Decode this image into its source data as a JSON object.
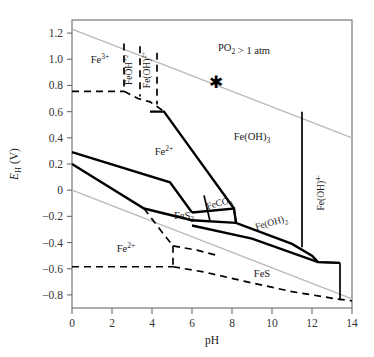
{
  "figure": {
    "title": "",
    "background": "#ffffff"
  },
  "chart_data": {
    "type": "line",
    "subtype": "eh-ph-pourbaix-diagram",
    "title": "",
    "xlabel": "pH",
    "ylabel": "EH (V)",
    "ylabel_parts": {
      "italic": "E",
      "subscript": "H",
      "unit": "(V)"
    },
    "xlim": [
      0,
      14
    ],
    "ylim": [
      -0.9,
      1.3
    ],
    "xticks": [
      0,
      2,
      4,
      6,
      8,
      10,
      12,
      14
    ],
    "xticklabels": [
      "0",
      "2",
      "4",
      "6",
      "8",
      "10",
      "12",
      "14"
    ],
    "yticks": [
      1.2,
      1.0,
      0.8,
      0.6,
      0.4,
      0.2,
      0,
      -0.2,
      -0.4,
      -0.6,
      -0.8
    ],
    "yticklabels": [
      "1.2",
      "1.0",
      "0.8",
      "0.6",
      "0.4",
      "0.2",
      "0",
      "-0.2",
      "-0.4",
      "-0.6",
      "-0.8"
    ],
    "grid": false,
    "legend": "none",
    "colors": {
      "axis": "#6b6b6b",
      "solid_boundary": "#000000",
      "dashed_boundary": "#000000",
      "water_stability_line": "#b8b8b8"
    },
    "annotations": [
      {
        "name": "po2-annotation",
        "text": "PO2 > 1 atm",
        "ph": 8.6,
        "eh": 1.06
      },
      {
        "name": "asterisk-marker",
        "text": "*",
        "ph": 7.2,
        "eh": 0.78
      }
    ],
    "field_labels": [
      {
        "name": "fe3plus-upper",
        "text": "Fe3+",
        "ph": 1.4,
        "eh": 0.97,
        "orientation": "horizontal"
      },
      {
        "name": "feoh2plus",
        "text": "FeOH+2",
        "ph": 3.0,
        "eh": 0.92,
        "orientation": "vertical"
      },
      {
        "name": "feoh2-plus",
        "text": "Fe(OH)2+",
        "ph": 3.9,
        "eh": 0.92,
        "orientation": "vertical"
      },
      {
        "name": "fe2plus-upper",
        "text": "Fe2+",
        "ph": 4.6,
        "eh": 0.27,
        "orientation": "horizontal"
      },
      {
        "name": "feoh3",
        "text": "Fe(OH)3",
        "ph": 9.0,
        "eh": 0.38,
        "orientation": "horizontal"
      },
      {
        "name": "feco3",
        "text": "FeCO3",
        "ph": 7.4,
        "eh": -0.12,
        "orientation": "rotated"
      },
      {
        "name": "fes2",
        "text": "FeS2",
        "ph": 5.6,
        "eh": -0.22,
        "orientation": "horizontal"
      },
      {
        "name": "feoh2",
        "text": "Fe(OH)2",
        "ph": 10.0,
        "eh": -0.27,
        "orientation": "rotated"
      },
      {
        "name": "feoh4-minus",
        "text": "Fe(OH)4-",
        "ph": 12.6,
        "eh": -0.02,
        "orientation": "vertical"
      },
      {
        "name": "fe2plus-lower",
        "text": "Fe2+",
        "ph": 2.7,
        "eh": -0.47,
        "orientation": "horizontal"
      },
      {
        "name": "fes",
        "text": "FeS",
        "ph": 9.5,
        "eh": -0.66,
        "orientation": "horizontal"
      }
    ],
    "water_stability_lines": [
      {
        "name": "o2-upper-line",
        "points": [
          [
            0,
            1.23
          ],
          [
            14,
            0.4
          ]
        ]
      },
      {
        "name": "h2-lower-line",
        "points": [
          [
            0,
            0.0
          ],
          [
            14,
            -0.83
          ]
        ]
      }
    ],
    "solid_boundaries": [
      {
        "name": "fe2-feoh3-upper",
        "points": [
          [
            3.9,
            0.6
          ],
          [
            4.6,
            0.6
          ],
          [
            8.1,
            -0.14
          ]
        ]
      },
      {
        "name": "fe2-fes2-left",
        "points": [
          [
            0.0,
            0.29
          ],
          [
            4.9,
            0.06
          ],
          [
            6.0,
            -0.17
          ]
        ]
      },
      {
        "name": "fe2-fes2-lower",
        "points": [
          [
            0.0,
            0.2
          ],
          [
            3.6,
            -0.14
          ],
          [
            6.0,
            -0.23
          ]
        ]
      },
      {
        "name": "fes2-top-run",
        "points": [
          [
            6.0,
            -0.17
          ],
          [
            8.1,
            -0.14
          ],
          [
            8.2,
            -0.25
          ]
        ]
      },
      {
        "name": "feco3-left-edge",
        "points": [
          [
            6.6,
            -0.04
          ],
          [
            6.9,
            -0.235
          ]
        ]
      },
      {
        "name": "feco3-right-edge",
        "points": [
          [
            8.1,
            -0.14
          ],
          [
            8.2,
            -0.25
          ]
        ]
      },
      {
        "name": "fes2-feoh2-base",
        "points": [
          [
            6.0,
            -0.23
          ],
          [
            8.2,
            -0.25
          ],
          [
            11.0,
            -0.41
          ],
          [
            12.0,
            -0.5
          ],
          [
            12.3,
            -0.55
          ]
        ]
      },
      {
        "name": "feoh2-feoh4-vertical",
        "points": [
          [
            11.5,
            0.6
          ],
          [
            11.5,
            -0.435
          ]
        ]
      },
      {
        "name": "feoh3-right-vertical",
        "points": [
          [
            11.5,
            0.6
          ],
          [
            11.5,
            0.6
          ]
        ]
      },
      {
        "name": "fes-top",
        "points": [
          [
            6.0,
            -0.27
          ],
          [
            9.0,
            -0.37
          ],
          [
            12.3,
            -0.55
          ],
          [
            13.4,
            -0.555
          ]
        ]
      },
      {
        "name": "feoh4-right-vertical",
        "points": [
          [
            13.4,
            -0.555
          ],
          [
            13.4,
            -0.84
          ]
        ]
      },
      {
        "name": "feoh2-lower-right",
        "points": [
          [
            12.3,
            -0.55
          ],
          [
            13.4,
            -0.555
          ]
        ]
      }
    ],
    "dashed_boundaries": [
      {
        "name": "fe3-top-horizontal",
        "points": [
          [
            0.0,
            0.755
          ],
          [
            2.6,
            0.755
          ]
        ]
      },
      {
        "name": "fe3-vertical",
        "points": [
          [
            2.6,
            1.12
          ],
          [
            2.6,
            0.755
          ]
        ]
      },
      {
        "name": "fe3-feoh2plus-slope",
        "points": [
          [
            2.6,
            0.755
          ],
          [
            3.3,
            0.7
          ],
          [
            3.9,
            0.675
          ],
          [
            4.2,
            0.645
          ],
          [
            4.6,
            0.6
          ]
        ]
      },
      {
        "name": "feoh2plus-vertical",
        "points": [
          [
            3.4,
            1.1
          ],
          [
            3.4,
            0.715
          ]
        ]
      },
      {
        "name": "feoh2plus2-vertical",
        "points": [
          [
            4.25,
            1.05
          ],
          [
            4.25,
            0.655
          ]
        ]
      },
      {
        "name": "fe2-lower-left-horizontal",
        "points": [
          [
            0.0,
            -0.585
          ],
          [
            5.05,
            -0.585
          ]
        ]
      },
      {
        "name": "fe2-lower-vertical",
        "points": [
          [
            5.05,
            -0.425
          ],
          [
            5.05,
            -0.585
          ]
        ]
      },
      {
        "name": "fe2-lower-slope",
        "points": [
          [
            3.6,
            -0.14
          ],
          [
            4.6,
            -0.34
          ],
          [
            5.05,
            -0.425
          ]
        ]
      },
      {
        "name": "fe2-lower-right-run",
        "points": [
          [
            5.05,
            -0.425
          ],
          [
            6.3,
            -0.46
          ],
          [
            7.3,
            -0.5
          ]
        ]
      },
      {
        "name": "fes-bottom-dash",
        "points": [
          [
            5.05,
            -0.585
          ],
          [
            6.6,
            -0.625
          ],
          [
            8.6,
            -0.695
          ],
          [
            11.0,
            -0.775
          ],
          [
            13.2,
            -0.83
          ],
          [
            14.0,
            -0.845
          ]
        ]
      }
    ]
  }
}
